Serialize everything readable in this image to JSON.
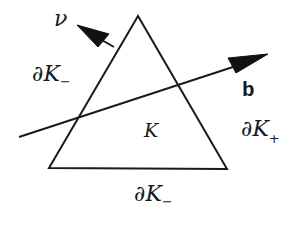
{
  "diagram": {
    "type": "geometry",
    "colors": {
      "stroke": "#1a1a1a",
      "background": "#ffffff"
    },
    "triangle": {
      "vertices": [
        [
          138,
          16
        ],
        [
          49,
          168
        ],
        [
          227,
          169
        ]
      ],
      "label": "K"
    },
    "vectors": {
      "normal": {
        "label": "ν",
        "tail": [
          114,
          47
        ],
        "tip": [
          77,
          25
        ]
      },
      "velocity": {
        "label": "b",
        "tail": [
          19,
          137
        ],
        "tip": [
          268,
          54
        ]
      }
    },
    "labels": {
      "nu": "ν",
      "b": "b",
      "K": "K",
      "boundary_left": {
        "partial": "∂",
        "symbol": "K",
        "subscript": "−"
      },
      "boundary_right": {
        "partial": "∂",
        "symbol": "K",
        "subscript": "+"
      },
      "boundary_bottom": {
        "partial": "∂",
        "symbol": "K",
        "subscript": "−"
      }
    }
  }
}
